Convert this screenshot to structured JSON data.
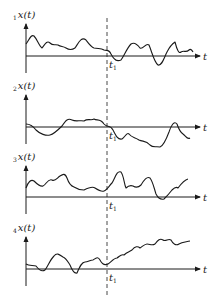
{
  "figure": {
    "time_instant_label": "t",
    "time_instant_subscript": "1",
    "axis_label_t": "t",
    "panels": [
      {
        "index": "1",
        "ylabel": "x(t)",
        "x_axis_y": 56,
        "top": 24,
        "path": "M26,44 C29,40 31,34 34,36 C37,39 39,46 42,48 C45,44 47,40 50,43 C53,46 55,44 58,45 C61,47 63,46 66,48 C69,50 72,50 75,48 C78,44 81,36 86,40 C89,44 91,47 94,48 C98,49 101,48 104,50 C107,51 109,49 111,54 C114,60 117,62 121,60 C124,56 127,48 131,44 C134,42 137,44 140,48 C143,50 146,42 149,45 C152,52 154,62 158,65 C162,66 164,58 167,52 C170,46 172,44 175,42 C177,50 179,54 181,52 C184,50 186,53 189,50 C191,48 193,52 193,52"
      },
      {
        "index": "2",
        "ylabel": "x(t)",
        "x_axis_y": 127,
        "top": 95,
        "path": "M26,124 C30,124 33,126 36,130 C40,134 46,136 50,135 C54,134 58,130 62,126 C66,120 68,118 72,120 C76,122 80,120 84,121 C88,118 91,121 94,119 C97,121 100,118 104,124 C107,128 110,124 113,130 C116,136 118,140 122,139 C125,137 127,132 129,134 C132,138 135,137 139,140 C143,142 146,140 150,145 C153,148 156,146 160,147 C163,146 166,140 169,132 C171,126 174,120 177,124 C179,130 180,132 183,134 C186,136 187,140 190,138"
      },
      {
        "index": "3",
        "ylabel": "x(t)",
        "x_axis_y": 197,
        "top": 166,
        "path": "M26,188 C28,182 31,179 34,181 C37,184 40,187 43,186 C46,185 48,178 52,180 C55,182 57,178 60,176 C63,174 65,173 67,178 C69,184 71,186 74,187 C77,189 80,190 84,190 C88,188 92,186 95,188 C98,190 101,192 104,191 C107,190 109,186 112,183 C115,178 117,170 121,172 C124,176 124,184 126,188 C128,186 130,185 133,186 C136,188 138,188 141,185 C144,180 147,176 150,178 C153,182 154,188 156,194 C158,198 160,200 164,199 C167,196 169,194 172,190 C174,188 176,186 178,188 C181,184 184,180 188,179"
      },
      {
        "index": "4",
        "ylabel": "x(t)",
        "x_axis_y": 269,
        "top": 237,
        "path": "M26,264 C29,266 33,265 36,266 C39,270 42,272 45,270 C48,266 50,260 54,256 C57,252 60,255 63,257 C66,258 68,262 70,265 C72,270 74,274 77,273 C80,266 82,262 85,262 C88,262 90,260 93,260 C96,258 98,256 100,260 C102,264 104,266 108,264 C111,262 114,258 117,258 C120,256 121,254 124,255 C127,252 129,252 132,250 C135,246 138,246 140,248 C143,246 145,244 147,244 C150,244 152,246 155,244 C158,240 160,238 163,240 C166,242 168,238 171,240 C173,244 176,246 179,244 C182,242 186,242 190,241"
      }
    ]
  }
}
